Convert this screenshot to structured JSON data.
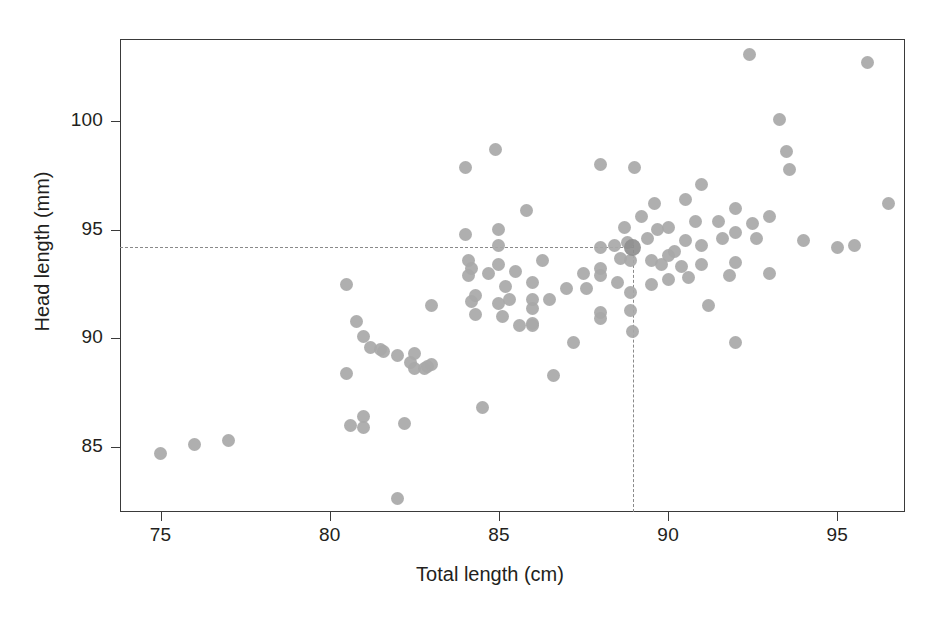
{
  "chart_data": {
    "type": "scatter",
    "title": "",
    "xlabel": "Total length (cm)",
    "ylabel": "Head length (mm)",
    "xlim": [
      73.8,
      97.0
    ],
    "ylim": [
      82.0,
      103.8
    ],
    "xticks": [
      75,
      80,
      85,
      90,
      95
    ],
    "yticks": [
      85,
      90,
      95,
      100
    ],
    "xtick_labels": [
      "75",
      "80",
      "85",
      "90",
      "95"
    ],
    "ytick_labels": [
      "85",
      "90",
      "95",
      "100"
    ],
    "grid": false,
    "legend": "none",
    "marker_color": "#a8a8a8",
    "highlight_color": "#8f8f8f",
    "reference_line_color": "#8a8a8a",
    "axis_color": "#3a3a3a",
    "background": "#ffffff",
    "reference_lines": [
      {
        "orientation": "horizontal",
        "value": 94.2,
        "style": "dashed",
        "x_from": 73.8,
        "x_to": 88.95
      },
      {
        "orientation": "vertical",
        "value": 88.95,
        "style": "dashed",
        "y_from": 82.0,
        "y_to": 94.3
      }
    ],
    "highlight_point": {
      "x": 88.95,
      "y": 94.2
    },
    "points": [
      [
        75.0,
        84.7
      ],
      [
        76.0,
        85.1
      ],
      [
        77.0,
        85.3
      ],
      [
        80.5,
        92.5
      ],
      [
        80.5,
        88.4
      ],
      [
        80.6,
        86.0
      ],
      [
        80.8,
        90.8
      ],
      [
        81.0,
        90.1
      ],
      [
        81.0,
        86.4
      ],
      [
        81.0,
        85.9
      ],
      [
        81.2,
        89.6
      ],
      [
        81.5,
        89.5
      ],
      [
        81.6,
        89.4
      ],
      [
        82.0,
        89.2
      ],
      [
        82.0,
        82.6
      ],
      [
        82.2,
        86.1
      ],
      [
        82.4,
        88.9
      ],
      [
        82.5,
        88.6
      ],
      [
        82.5,
        89.3
      ],
      [
        82.8,
        88.6
      ],
      [
        82.9,
        88.7
      ],
      [
        83.0,
        91.5
      ],
      [
        83.0,
        88.8
      ],
      [
        84.0,
        94.8
      ],
      [
        84.0,
        97.9
      ],
      [
        84.1,
        92.9
      ],
      [
        84.1,
        93.6
      ],
      [
        84.2,
        93.2
      ],
      [
        84.2,
        91.7
      ],
      [
        84.3,
        92.0
      ],
      [
        84.3,
        91.1
      ],
      [
        84.5,
        86.8
      ],
      [
        84.7,
        93.0
      ],
      [
        84.9,
        98.7
      ],
      [
        85.0,
        95.0
      ],
      [
        85.0,
        94.3
      ],
      [
        85.0,
        93.4
      ],
      [
        85.0,
        91.6
      ],
      [
        85.1,
        91.0
      ],
      [
        85.2,
        92.4
      ],
      [
        85.3,
        91.8
      ],
      [
        85.5,
        93.1
      ],
      [
        85.6,
        90.6
      ],
      [
        85.8,
        95.9
      ],
      [
        86.0,
        92.6
      ],
      [
        86.0,
        91.4
      ],
      [
        86.0,
        91.8
      ],
      [
        86.0,
        90.7
      ],
      [
        86.0,
        90.6
      ],
      [
        86.3,
        93.6
      ],
      [
        86.5,
        91.8
      ],
      [
        86.6,
        88.3
      ],
      [
        87.0,
        92.3
      ],
      [
        87.2,
        89.8
      ],
      [
        87.5,
        93.0
      ],
      [
        87.6,
        92.3
      ],
      [
        88.0,
        98.0
      ],
      [
        88.0,
        94.2
      ],
      [
        88.0,
        93.2
      ],
      [
        88.0,
        92.9
      ],
      [
        88.0,
        91.2
      ],
      [
        88.0,
        90.9
      ],
      [
        88.4,
        94.3
      ],
      [
        88.5,
        92.6
      ],
      [
        88.6,
        93.7
      ],
      [
        88.7,
        95.1
      ],
      [
        88.8,
        94.4
      ],
      [
        88.9,
        93.6
      ],
      [
        88.9,
        92.1
      ],
      [
        88.9,
        91.3
      ],
      [
        88.95,
        90.3
      ],
      [
        89.0,
        97.9
      ],
      [
        89.2,
        95.6
      ],
      [
        89.4,
        94.6
      ],
      [
        89.5,
        93.6
      ],
      [
        89.5,
        92.5
      ],
      [
        89.6,
        96.2
      ],
      [
        89.7,
        95.0
      ],
      [
        89.8,
        93.4
      ],
      [
        90.0,
        95.1
      ],
      [
        90.0,
        93.8
      ],
      [
        90.0,
        92.7
      ],
      [
        90.2,
        94.0
      ],
      [
        90.4,
        93.3
      ],
      [
        90.5,
        96.4
      ],
      [
        90.5,
        94.5
      ],
      [
        90.6,
        92.8
      ],
      [
        90.8,
        95.4
      ],
      [
        91.0,
        97.1
      ],
      [
        91.0,
        94.3
      ],
      [
        91.0,
        93.4
      ],
      [
        91.2,
        91.5
      ],
      [
        91.5,
        95.4
      ],
      [
        91.6,
        94.6
      ],
      [
        91.8,
        92.9
      ],
      [
        92.0,
        96.0
      ],
      [
        92.0,
        94.9
      ],
      [
        92.0,
        93.5
      ],
      [
        92.0,
        89.8
      ],
      [
        92.4,
        103.1
      ],
      [
        92.5,
        95.3
      ],
      [
        92.6,
        94.6
      ],
      [
        93.0,
        95.6
      ],
      [
        93.0,
        93.0
      ],
      [
        93.3,
        100.1
      ],
      [
        93.5,
        98.6
      ],
      [
        93.6,
        97.8
      ],
      [
        94.0,
        94.5
      ],
      [
        95.0,
        94.2
      ],
      [
        95.5,
        94.3
      ],
      [
        95.9,
        102.7
      ],
      [
        96.5,
        96.2
      ]
    ]
  },
  "axes": {
    "x_title": "Total length (cm)",
    "y_title": "Head length (mm)"
  }
}
